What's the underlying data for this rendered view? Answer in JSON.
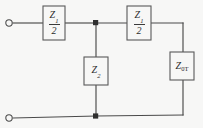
{
  "diagram": {
    "background_color": "#f7f7f6",
    "line_color": "#4a4a4a",
    "text_color": "#2b2b2b",
    "components": [
      {
        "id": "series-z1-half-left",
        "type": "impedance-box",
        "orientation": "horizontal",
        "numerator": "Z",
        "numerator_subscript": "1",
        "denominator": "2",
        "label_text": "Z1/2"
      },
      {
        "id": "series-z1-half-right",
        "type": "impedance-box",
        "orientation": "horizontal",
        "numerator": "Z",
        "numerator_subscript": "1",
        "denominator": "2",
        "label_text": "Z1/2"
      },
      {
        "id": "shunt-z2",
        "type": "impedance-box",
        "orientation": "vertical",
        "symbol": "Z",
        "subscript": "2",
        "label_text": "Z2"
      },
      {
        "id": "termination-z0t",
        "type": "impedance-box",
        "orientation": "vertical",
        "symbol": "Z",
        "subscript": "0T",
        "label_text": "Z0T"
      }
    ],
    "terminals": [
      {
        "id": "input-terminal-top",
        "style": "open-circle",
        "position": "top-left"
      },
      {
        "id": "input-terminal-bottom",
        "style": "open-circle",
        "position": "bottom-left"
      }
    ],
    "junctions": [
      {
        "id": "node-top-mid",
        "style": "filled-square"
      },
      {
        "id": "node-bottom-mid",
        "style": "filled-square"
      }
    ]
  }
}
